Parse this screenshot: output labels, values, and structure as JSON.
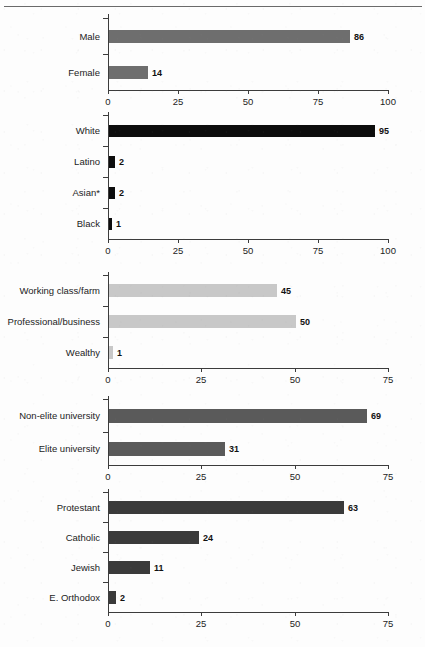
{
  "page": {
    "top_cropped_text": "",
    "background_color": "#fdfdfd"
  },
  "chart_data": [
    {
      "id": "gender",
      "type": "bar",
      "orientation": "horizontal",
      "title": "",
      "xlabel": "",
      "ylabel": "",
      "bar_color": "#6e6e6e",
      "xlim": [
        0,
        100
      ],
      "xticks": [
        0,
        25,
        50,
        75,
        100
      ],
      "xtick_labels": [
        "0",
        "25",
        "50",
        "75",
        "100"
      ],
      "grid": false,
      "legend": false,
      "categories": [
        "Male",
        "Female"
      ],
      "values": [
        86,
        14
      ],
      "data_labels": [
        "86",
        "14"
      ]
    },
    {
      "id": "race",
      "type": "bar",
      "orientation": "horizontal",
      "title": "",
      "xlabel": "",
      "ylabel": "",
      "bar_color": "#0d0d0d",
      "xlim": [
        0,
        100
      ],
      "xticks": [
        0,
        25,
        50,
        75,
        100
      ],
      "xtick_labels": [
        "0",
        "25",
        "50",
        "75",
        "100"
      ],
      "grid": false,
      "legend": false,
      "categories": [
        "White",
        "Latino",
        "Asian*",
        "Black"
      ],
      "values": [
        95,
        2,
        2,
        1
      ],
      "data_labels": [
        "95",
        "2",
        "2",
        "1"
      ]
    },
    {
      "id": "class-origin",
      "type": "bar",
      "orientation": "horizontal",
      "title": "",
      "xlabel": "",
      "ylabel": "",
      "bar_color": "#c8c8c8",
      "xlim": [
        0,
        75
      ],
      "xticks": [
        0,
        25,
        50,
        75
      ],
      "xtick_labels": [
        "0",
        "25",
        "50",
        "75"
      ],
      "grid": false,
      "legend": false,
      "categories": [
        "Working class/farm",
        "Professional/business",
        "Wealthy"
      ],
      "values": [
        45,
        50,
        1
      ],
      "data_labels": [
        "45",
        "50",
        "1"
      ]
    },
    {
      "id": "education",
      "type": "bar",
      "orientation": "horizontal",
      "title": "",
      "xlabel": "",
      "ylabel": "",
      "bar_color": "#5a5a5a",
      "xlim": [
        0,
        75
      ],
      "xticks": [
        0,
        25,
        50,
        75
      ],
      "xtick_labels": [
        "0",
        "25",
        "50",
        "75"
      ],
      "grid": false,
      "legend": false,
      "categories": [
        "Non-elite university",
        "Elite university"
      ],
      "values": [
        69,
        31
      ],
      "data_labels": [
        "69",
        "31"
      ]
    },
    {
      "id": "religion",
      "type": "bar",
      "orientation": "horizontal",
      "title": "",
      "xlabel": "",
      "ylabel": "",
      "bar_color": "#3a3a3a",
      "xlim": [
        0,
        75
      ],
      "xticks": [
        0,
        25,
        50,
        75
      ],
      "xtick_labels": [
        "0",
        "25",
        "50",
        "75"
      ],
      "grid": false,
      "legend": false,
      "categories": [
        "Protestant",
        "Catholic",
        "Jewish",
        "E. Orthodox"
      ],
      "values": [
        63,
        24,
        11,
        2
      ],
      "data_labels": [
        "63",
        "24",
        "11",
        "2"
      ]
    }
  ],
  "layout": {
    "panels": [
      {
        "top": 14,
        "height": 92,
        "row_height": 36,
        "bar_height": 13,
        "first_row_offset": 4
      },
      {
        "top": 112,
        "height": 140,
        "row_height": 31,
        "bar_height": 12,
        "first_row_offset": 3
      },
      {
        "top": 272,
        "height": 100,
        "row_height": 31,
        "bar_height": 13,
        "first_row_offset": 3
      },
      {
        "top": 396,
        "height": 72,
        "row_height": 33,
        "bar_height": 14,
        "first_row_offset": 3
      },
      {
        "top": 489,
        "height": 132,
        "row_height": 30,
        "bar_height": 13,
        "first_row_offset": 3
      }
    ],
    "plot_left": 108,
    "plot_right": 388
  }
}
